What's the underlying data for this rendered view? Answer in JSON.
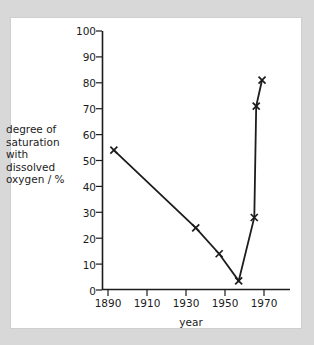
{
  "figure": {
    "background_color": "#d8d8d8",
    "panel_color": "#ffffff",
    "panel_border_color": "#cfcfcf",
    "ink_color": "#1c1c1c"
  },
  "axis_titles": {
    "y": "degree of\nsaturation\nwith\ndissolved\noxygen / %",
    "x": "year"
  },
  "ticks": {
    "y": [
      "100",
      "90",
      "80",
      "70",
      "60",
      "50",
      "40",
      "30",
      "20",
      "10",
      "0"
    ],
    "x": [
      "1890",
      "1910",
      "1930",
      "1950",
      "1970"
    ]
  },
  "chart_data": {
    "type": "line",
    "title": "",
    "xlabel": "year",
    "ylabel": "degree of saturation with dissolved oxygen / %",
    "xlim": [
      1890,
      1975
    ],
    "ylim": [
      0,
      100
    ],
    "xticks": [
      1890,
      1910,
      1930,
      1950,
      1970
    ],
    "yticks": [
      0,
      10,
      20,
      30,
      40,
      50,
      60,
      70,
      80,
      90,
      100
    ],
    "grid": false,
    "legend": null,
    "marker": "x",
    "series": [
      {
        "name": "degree of saturation with dissolved oxygen",
        "x": [
          1893,
          1935,
          1947,
          1957,
          1965,
          1966,
          1969
        ],
        "values": [
          54,
          24,
          14,
          3.5,
          28,
          71,
          81
        ]
      }
    ]
  }
}
